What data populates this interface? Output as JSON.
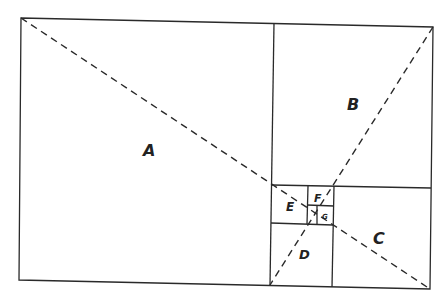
{
  "colors": {
    "line": "#2a2a2a",
    "background": "#ffffff"
  },
  "labels": {
    "A": "A",
    "B": "B",
    "C": "C",
    "D": "D",
    "E": "E",
    "F": "F",
    "G": "G"
  }
}
